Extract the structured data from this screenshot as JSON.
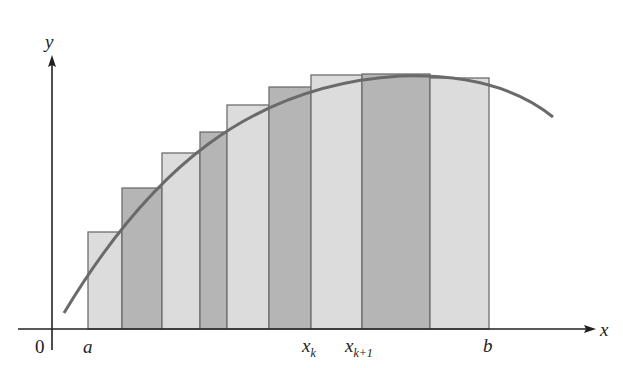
{
  "diagram": {
    "type": "riemann-sum-upper",
    "colors": {
      "bar_light": "#dcdcdc",
      "bar_dark": "#b5b5b5",
      "bar_stroke": "#6e6e6e",
      "curve": "#6a6a6a",
      "axis": "#222222"
    },
    "axes": {
      "x_label": "x",
      "y_label": "y",
      "origin_label": "0"
    },
    "tick_labels": {
      "a": "a",
      "xk_base": "x",
      "xk_sub": "k",
      "xk1_base": "x",
      "xk1_sub": "k+1",
      "b": "b"
    },
    "bars": [
      {
        "x0": 88,
        "x1": 122,
        "top": 232,
        "shade": "light"
      },
      {
        "x0": 122,
        "x1": 162,
        "top": 188,
        "shade": "dark"
      },
      {
        "x0": 162,
        "x1": 200,
        "top": 153,
        "shade": "light"
      },
      {
        "x0": 200,
        "x1": 227,
        "top": 132,
        "shade": "dark"
      },
      {
        "x0": 227,
        "x1": 269,
        "top": 105,
        "shade": "light"
      },
      {
        "x0": 269,
        "x1": 311,
        "top": 87,
        "shade": "dark"
      },
      {
        "x0": 311,
        "x1": 362,
        "top": 75,
        "shade": "light"
      },
      {
        "x0": 362,
        "x1": 430,
        "top": 74,
        "shade": "dark"
      },
      {
        "x0": 430,
        "x1": 489,
        "top": 78,
        "shade": "light"
      }
    ]
  }
}
